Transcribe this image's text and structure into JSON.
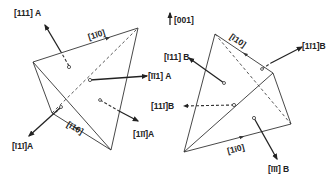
{
  "figure": {
    "axis_indicator": {
      "label": "[001]",
      "direction": "up"
    },
    "tetrahedron_A": {
      "name": "A",
      "edges": [
        {
          "label": "[1̅1̅0]",
          "display": "[1ī0]",
          "position": "top edge, arrow toward right vertex"
        },
        {
          "label": "[1̅1̅0]",
          "display": "[ī10]",
          "position": "bottom edge, arrow toward left vertex"
        }
      ],
      "face_normals": [
        {
          "label": "[111] A",
          "position": "upper-left"
        },
        {
          "label": "[īī1] A",
          "position": "right"
        },
        {
          "label": "[ī1ī]A",
          "position": "lower-left"
        },
        {
          "label": "[1īī]A",
          "position": "lower-right"
        }
      ]
    },
    "tetrahedron_B": {
      "name": "B",
      "edges": [
        {
          "label": "[ī10]",
          "position": "top edge"
        },
        {
          "label": "[1ī0]",
          "position": "bottom edge"
        }
      ],
      "face_normals": [
        {
          "label": "[ī11] B",
          "position": "upper-left"
        },
        {
          "label": "[1ī1]B",
          "position": "upper-right"
        },
        {
          "label": "[11ī]B",
          "position": "left, hidden face"
        },
        {
          "label": "[īīī] B",
          "position": "lower"
        }
      ]
    }
  },
  "labels": {
    "axis": "[001]",
    "a_top_edge": "[1ī0]",
    "a_bottom_edge": "[ī10]",
    "a_n1": "[111] A",
    "a_n2": "[īī1] A",
    "a_n3": "[ī1ī]A",
    "a_n4": "[1īī]A",
    "b_top_edge": "[ī10]",
    "b_bottom_edge": "[1ī0]",
    "b_n1": "[ī11] B",
    "b_n2": "[1ī1]B",
    "b_n3": "[11ī]B",
    "b_n4": "[īīī] B"
  }
}
